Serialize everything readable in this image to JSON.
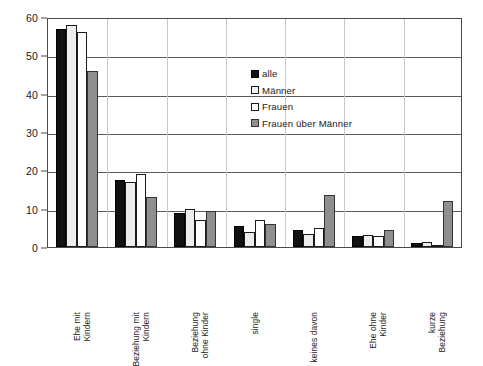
{
  "chart_data": {
    "type": "bar",
    "title": "",
    "subtitle": "",
    "xlabel": "",
    "ylabel": "",
    "ylim": [
      0,
      60
    ],
    "y_ticks": [
      0,
      10,
      20,
      30,
      40,
      50,
      60
    ],
    "grid": true,
    "legend_position": "inside-upper-center",
    "categories": [
      "Ehe mit Kindern",
      "Beziehung mit Kindern",
      "Beziehung ohne Kinder",
      "single",
      "keines davon",
      "Ehe ohne Kinder",
      "kurze Beziehung"
    ],
    "category_lines": [
      [
        "Ehe mit",
        "Kindern"
      ],
      [
        "Beziehung mit",
        "Kindern"
      ],
      [
        "Beziehung",
        "ohne Kinder"
      ],
      [
        "single",
        ""
      ],
      [
        "keines davon",
        ""
      ],
      [
        "Ehe ohne",
        "Kinder"
      ],
      [
        "kurze",
        "Beziehung"
      ]
    ],
    "series": [
      {
        "name": "alle",
        "color": "#111111",
        "values": [
          57,
          17.5,
          9,
          5.5,
          4.5,
          3,
          1
        ]
      },
      {
        "name": "Männer",
        "color": "#ededed",
        "values": [
          58,
          17,
          10,
          4,
          3.5,
          3.2,
          1.3
        ]
      },
      {
        "name": "Frauen",
        "color": "#ffffff",
        "values": [
          56,
          19,
          7,
          7,
          5,
          2.8,
          0.4
        ]
      },
      {
        "name": "Frauen über Männer",
        "color": "#8f8f8f",
        "values": [
          46,
          13,
          9.5,
          6,
          13.5,
          4.5,
          12
        ]
      }
    ]
  },
  "legend": {
    "items": [
      {
        "label": "alle",
        "swatch": "legend-swatch-alle"
      },
      {
        "label": "Männer",
        "swatch": "legend-swatch-maenner"
      },
      {
        "label": "Frauen",
        "swatch": "legend-swatch-frauen"
      },
      {
        "label": "Frauen über Männer",
        "swatch": "legend-swatch-frauen-ueber-maenner"
      }
    ]
  }
}
